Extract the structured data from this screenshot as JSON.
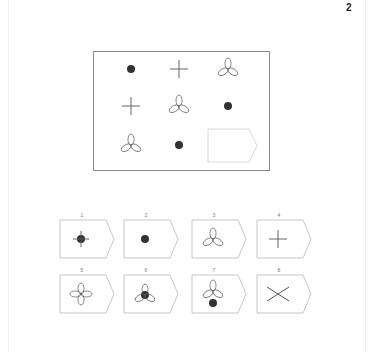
{
  "page": {
    "number": "2"
  },
  "matrix": {
    "rows": [
      [
        "dot",
        "plus",
        "trefoil"
      ],
      [
        "plus",
        "trefoil",
        "dot"
      ],
      [
        "trefoil",
        "dot",
        "blank-answer-slot"
      ]
    ]
  },
  "options": [
    {
      "label": "1",
      "figure": "plus-with-dot"
    },
    {
      "label": "2",
      "figure": "dot"
    },
    {
      "label": "3",
      "figure": "trefoil"
    },
    {
      "label": "4",
      "figure": "plus"
    },
    {
      "label": "5",
      "figure": "four-petal"
    },
    {
      "label": "6",
      "figure": "trefoil-with-dot"
    },
    {
      "label": "7",
      "figure": "trefoil-with-dot-below"
    },
    {
      "label": "8",
      "figure": "x-cross"
    }
  ],
  "colors": {
    "stroke": "#555555",
    "dot": "#333333",
    "border": "#8a8a8a"
  }
}
